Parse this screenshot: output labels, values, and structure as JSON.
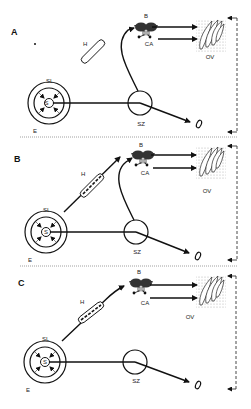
{
  "figure": {
    "panels": [
      {
        "id": "A",
        "label": "A",
        "labels": {
          "H": "H",
          "B": "B",
          "CA": "CA",
          "OV": "OV",
          "SL": "SL",
          "S": "S",
          "SZ": "SZ",
          "E": "E"
        },
        "hormone_tube_state": "empty",
        "pathway_from_brain": "none"
      },
      {
        "id": "B",
        "label": "B",
        "labels": {
          "H": "H",
          "B": "B",
          "CA": "CA",
          "OV": "OV",
          "SL": "SL",
          "S": "S",
          "SZ": "SZ",
          "E": "E"
        },
        "hormone_tube_state": "filled",
        "pathway_from_brain": "to-brain"
      },
      {
        "id": "C",
        "label": "C",
        "labels": {
          "H": "H",
          "B": "B",
          "CA": "CA",
          "OV": "OV",
          "SL": "SL",
          "S": "S",
          "SZ": "SZ",
          "E": "E"
        },
        "hormone_tube_state": "filled",
        "pathway_from_brain": "to-brain"
      }
    ]
  }
}
